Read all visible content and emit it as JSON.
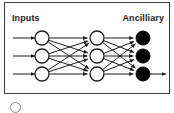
{
  "figure": {
    "labels": {
      "inputs": "Inputs",
      "ancilliary": "Ancilliary"
    },
    "frame": {
      "border_color": "#3a3a3a"
    },
    "colors": {
      "node_outline": "#1d1d1d",
      "node_input_fill": "#ffffff",
      "node_hidden_fill": "#ffffff",
      "node_output_fill": "#000000",
      "edge": "#1d1d1d",
      "text": "#1d1d1d",
      "background": "#ffffff"
    },
    "layers": [
      {
        "name": "input-layer",
        "style": "hollow",
        "nodes": [
          {
            "id": "input-node-1",
            "cx": 42,
            "cy": 38,
            "r": 7
          },
          {
            "id": "input-node-2",
            "cx": 42,
            "cy": 56,
            "r": 7
          },
          {
            "id": "input-node-3",
            "cx": 42,
            "cy": 74,
            "r": 7
          }
        ]
      },
      {
        "name": "hidden-layer",
        "style": "hollow",
        "nodes": [
          {
            "id": "hidden-node-1",
            "cx": 97,
            "cy": 38,
            "r": 7
          },
          {
            "id": "hidden-node-2",
            "cx": 97,
            "cy": 56,
            "r": 7
          },
          {
            "id": "hidden-node-3",
            "cx": 97,
            "cy": 74,
            "r": 7
          }
        ]
      },
      {
        "name": "output-layer",
        "style": "filled",
        "nodes": [
          {
            "id": "output-node-1",
            "cx": 143,
            "cy": 38,
            "r": 7
          },
          {
            "id": "output-node-2",
            "cx": 143,
            "cy": 56,
            "r": 7
          },
          {
            "id": "output-node-3",
            "cx": 143,
            "cy": 74,
            "r": 7
          }
        ]
      }
    ],
    "entry_arrows": [
      {
        "id": "entry-arrow-1",
        "x1": 13,
        "y1": 38,
        "x2": 35,
        "y2": 38
      },
      {
        "id": "entry-arrow-2",
        "x1": 13,
        "y1": 56,
        "x2": 35,
        "y2": 56
      },
      {
        "id": "entry-arrow-3",
        "x1": 13,
        "y1": 74,
        "x2": 35,
        "y2": 74
      }
    ],
    "exit_arrows": [
      {
        "id": "exit-arrow-1",
        "x1": 150,
        "y1": 74,
        "x2": 166,
        "y2": 74
      }
    ]
  },
  "legend": {
    "item_label": "",
    "circle_name": "hollow-node-swatch"
  }
}
